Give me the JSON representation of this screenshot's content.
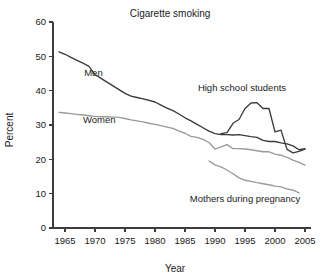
{
  "chart_data": {
    "type": "line",
    "title": "Cigarette smoking",
    "xlabel": "Year",
    "ylabel": "Percent",
    "xlim": [
      1963,
      2006
    ],
    "ylim": [
      0,
      60
    ],
    "xticks": [
      1965,
      1970,
      1975,
      1980,
      1985,
      1990,
      1995,
      2000,
      2005
    ],
    "yticks": [
      0,
      10,
      20,
      30,
      40,
      50,
      60
    ],
    "grid": false,
    "legend": "inline-annotations",
    "series": [
      {
        "name": "Men",
        "color": "#3a3a3a",
        "label_x": 1968.2,
        "label_y": 44.2,
        "x": [
          1964,
          1965,
          1966,
          1967,
          1968,
          1969,
          1970,
          1971,
          1972,
          1973,
          1974,
          1975,
          1976,
          1977,
          1978,
          1979,
          1980,
          1981,
          1982,
          1983,
          1984,
          1985,
          1986,
          1987,
          1988,
          1989,
          1990,
          1991,
          1992,
          1993,
          1994,
          1995,
          1996,
          1997,
          1998,
          1999,
          2000,
          2001,
          2002,
          2003,
          2004,
          2005
        ],
        "y": [
          51.3,
          50.6,
          49.7,
          48.8,
          48.0,
          47.1,
          44.7,
          43.6,
          42.5,
          41.4,
          40.3,
          39.2,
          38.4,
          38.0,
          37.6,
          37.2,
          36.7,
          35.8,
          34.9,
          34.2,
          33.2,
          32.1,
          31.2,
          30.2,
          29.2,
          28.2,
          27.5,
          27.2,
          27.2,
          27.1,
          27.2,
          26.9,
          26.6,
          26.4,
          25.5,
          25.2,
          25.2,
          24.8,
          24.5,
          23.9,
          22.8,
          23.1
        ]
      },
      {
        "name": "Women",
        "color": "#9a9a9a",
        "label_x": 1968.0,
        "label_y": 30.5,
        "x": [
          1964,
          1965,
          1966,
          1967,
          1968,
          1969,
          1970,
          1971,
          1972,
          1973,
          1974,
          1975,
          1976,
          1977,
          1978,
          1979,
          1980,
          1981,
          1982,
          1983,
          1984,
          1985,
          1986,
          1987,
          1988,
          1989,
          1990,
          1991,
          1992,
          1993,
          1994,
          1995,
          1996,
          1997,
          1998,
          1999,
          2000,
          2001,
          2002,
          2003,
          2004,
          2005
        ],
        "y": [
          33.7,
          33.5,
          33.3,
          33.1,
          32.9,
          32.7,
          32.5,
          32.4,
          32.4,
          32.3,
          32.2,
          31.9,
          31.5,
          31.2,
          30.9,
          30.5,
          30.2,
          29.8,
          29.4,
          29.0,
          28.2,
          27.6,
          26.7,
          26.4,
          25.8,
          24.9,
          23.0,
          23.6,
          24.3,
          23.1,
          23.1,
          23.0,
          22.8,
          22.5,
          22.2,
          22.2,
          21.5,
          21.2,
          20.6,
          19.8,
          19.1,
          18.3
        ]
      },
      {
        "name": "High school students",
        "color": "#3a3a3a",
        "label_x": 1994.5,
        "label_y": 40.0,
        "x": [
          1991,
          1992,
          1993,
          1994,
          1995,
          1996,
          1997,
          1998,
          1999,
          2000,
          2001,
          2002,
          2003,
          2004,
          2005
        ],
        "y": [
          27.5,
          27.8,
          30.5,
          31.6,
          34.8,
          36.4,
          36.5,
          34.8,
          34.8,
          28.0,
          28.5,
          22.9,
          21.9,
          22.3,
          23.0
        ]
      },
      {
        "name": "Mothers during pregnancy",
        "color": "#9a9a9a",
        "label_x": 1995.0,
        "label_y": 7.5,
        "x": [
          1989,
          1990,
          1991,
          1992,
          1993,
          1994,
          1995,
          1996,
          1997,
          1998,
          1999,
          2000,
          2001,
          2002,
          2003,
          2004
        ],
        "y": [
          19.5,
          18.4,
          17.8,
          16.9,
          15.8,
          14.6,
          13.9,
          13.6,
          13.2,
          12.9,
          12.6,
          12.2,
          12.0,
          11.4,
          11.0,
          10.2
        ]
      }
    ]
  }
}
